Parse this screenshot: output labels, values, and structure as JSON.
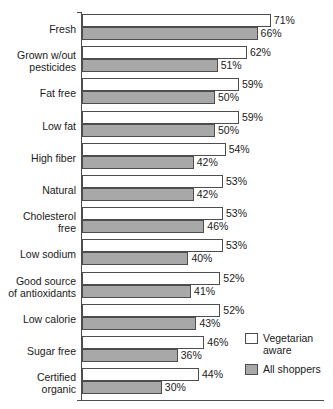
{
  "chart_data": {
    "type": "bar",
    "orientation": "horizontal",
    "title": "",
    "xlabel": "",
    "ylabel": "",
    "xlim": [
      0,
      100
    ],
    "grid": false,
    "legend_position": "bottom-right",
    "categories": [
      "Fresh",
      "Grown w/out pesticides",
      "Fat free",
      "Low fat",
      "High fiber",
      "Natural",
      "Cholesterol free",
      "Low sodium",
      "Good source of antioxidants",
      "Low calorie",
      "Sugar free",
      "Certified organic"
    ],
    "category_lines": [
      [
        "Fresh"
      ],
      [
        "Grown w/out",
        "pesticides"
      ],
      [
        "Fat free"
      ],
      [
        "Low fat"
      ],
      [
        "High fiber"
      ],
      [
        "Natural"
      ],
      [
        "Cholesterol",
        "free"
      ],
      [
        "Low sodium"
      ],
      [
        "Good source",
        "of antioxidants"
      ],
      [
        "Low calorie"
      ],
      [
        "Sugar free"
      ],
      [
        "Certified",
        "organic"
      ]
    ],
    "series": [
      {
        "name": "Vegetarian aware",
        "color": "#ffffff",
        "values": [
          71,
          62,
          59,
          59,
          54,
          53,
          53,
          53,
          52,
          52,
          46,
          44
        ],
        "labels": [
          "71%",
          "62%",
          "59%",
          "59%",
          "54%",
          "53%",
          "53%",
          "53%",
          "52%",
          "52%",
          "46%",
          "44%"
        ]
      },
      {
        "name": "All shoppers",
        "color": "#a8a8a8",
        "values": [
          66,
          51,
          50,
          50,
          42,
          42,
          46,
          40,
          41,
          43,
          36,
          30
        ],
        "labels": [
          "66%",
          "51%",
          "50%",
          "50%",
          "42%",
          "42%",
          "46%",
          "40%",
          "41%",
          "43%",
          "36%",
          "30%"
        ]
      }
    ]
  },
  "legend": {
    "items": [
      {
        "label_line1": "Vegetarian",
        "label_line2": "aware",
        "swatch": "veg"
      },
      {
        "label_line1": "All shoppers",
        "label_line2": "",
        "swatch": "all"
      }
    ]
  }
}
